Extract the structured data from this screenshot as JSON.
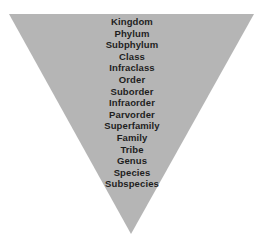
{
  "diagram": {
    "type": "inverted-triangle-hierarchy",
    "fill_color": "#b5b5b5",
    "text_color": "#1e1e1e",
    "background_color": "#ffffff",
    "ranks": [
      "Kingdom",
      "Phylum",
      "Subphylum",
      "Class",
      "Infraclass",
      "Order",
      "Suborder",
      "Infraorder",
      "Parvorder",
      "Superfamily",
      "Family",
      "Tribe",
      "Genus",
      "Species",
      "Subspecies"
    ]
  }
}
